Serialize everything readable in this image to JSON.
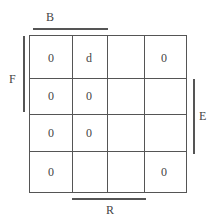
{
  "kmap": {
    "variables": {
      "top": "B",
      "left": "F",
      "right": "E",
      "bottom": "R"
    },
    "cells": [
      [
        "0",
        "d",
        "",
        "0"
      ],
      [
        "0",
        "0",
        "",
        ""
      ],
      [
        "0",
        "0",
        "",
        ""
      ],
      [
        "0",
        "",
        "",
        "0"
      ]
    ]
  }
}
